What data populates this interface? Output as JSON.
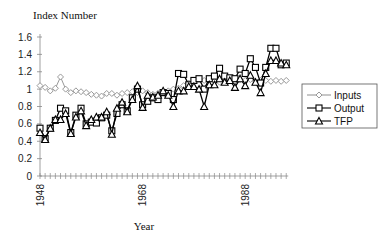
{
  "chart_data": {
    "type": "line",
    "title": "",
    "ylabel": "Index Number",
    "xlabel": "Year",
    "ylim": [
      0,
      1.6
    ],
    "yticks": [
      0,
      0.2,
      0.4,
      0.6,
      0.8,
      1,
      1.2,
      1.4,
      1.6
    ],
    "ytick_labels": [
      "0",
      "0.2",
      "0.4",
      "0.6",
      "0.8",
      "1",
      "1.2",
      "1.4",
      "1.6"
    ],
    "xtick_labels": [
      "1948",
      "1968",
      "1988"
    ],
    "grid": false,
    "legend_position": "right",
    "x": [
      1948,
      1949,
      1950,
      1951,
      1952,
      1953,
      1954,
      1955,
      1956,
      1957,
      1958,
      1959,
      1960,
      1961,
      1962,
      1963,
      1964,
      1965,
      1966,
      1967,
      1968,
      1969,
      1970,
      1971,
      1972,
      1973,
      1974,
      1975,
      1976,
      1977,
      1978,
      1979,
      1980,
      1981,
      1982,
      1983,
      1984,
      1985,
      1986,
      1987,
      1988,
      1989,
      1990,
      1991,
      1992,
      1993,
      1994,
      1995,
      1996
    ],
    "series": [
      {
        "name": "Inputs",
        "marker": "diamond",
        "color": "#999999",
        "values": [
          1.04,
          1.02,
          0.98,
          1.01,
          1.14,
          1.0,
          0.96,
          0.98,
          0.97,
          0.96,
          0.94,
          0.93,
          0.92,
          0.95,
          0.95,
          0.93,
          0.95,
          0.96,
          0.97,
          0.96,
          0.98,
          0.96,
          0.94,
          0.95,
          0.96,
          0.98,
          1.0,
          1.01,
          1.04,
          1.07,
          1.09,
          1.11,
          1.1,
          1.1,
          1.09,
          1.08,
          1.1,
          1.1,
          1.09,
          1.11,
          1.1,
          1.11,
          1.09,
          1.1,
          1.1,
          1.09,
          1.1,
          1.09,
          1.1
        ]
      },
      {
        "name": "Output",
        "marker": "square",
        "color": "#000000",
        "values": [
          0.55,
          0.43,
          0.55,
          0.64,
          0.78,
          0.75,
          0.5,
          0.7,
          0.78,
          0.6,
          0.62,
          0.61,
          0.67,
          0.7,
          0.52,
          0.72,
          0.82,
          0.75,
          0.9,
          1.0,
          0.82,
          0.86,
          0.9,
          0.88,
          0.96,
          0.95,
          0.88,
          1.18,
          1.17,
          1.05,
          1.1,
          1.12,
          1.0,
          1.12,
          1.15,
          1.24,
          1.15,
          1.13,
          1.12,
          1.23,
          1.18,
          1.35,
          1.25,
          1.07,
          1.25,
          1.47,
          1.47,
          1.28,
          1.3
        ]
      },
      {
        "name": "TFP",
        "marker": "triangle",
        "color": "#000000",
        "values": [
          0.5,
          0.42,
          0.55,
          0.65,
          0.65,
          0.72,
          0.49,
          0.68,
          0.75,
          0.58,
          0.65,
          0.68,
          0.68,
          0.74,
          0.48,
          0.78,
          0.85,
          0.74,
          0.88,
          1.04,
          0.79,
          0.93,
          0.91,
          0.93,
          0.98,
          0.93,
          0.8,
          0.98,
          0.98,
          1.03,
          1.03,
          1.0,
          0.8,
          1.05,
          1.05,
          1.12,
          1.08,
          1.1,
          1.02,
          1.12,
          1.04,
          1.16,
          1.08,
          0.96,
          1.18,
          1.33,
          1.33,
          1.3,
          1.28
        ]
      }
    ]
  },
  "labels": {
    "yaxis_title": "Index Number",
    "xaxis_title": "Year"
  },
  "legend": {
    "items": [
      "Inputs",
      "Output",
      "TFP"
    ]
  }
}
